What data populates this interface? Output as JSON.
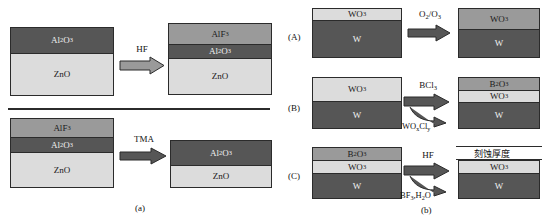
{
  "figure": {
    "panel_a_tag": "(a)",
    "panel_b_tag": "(b)"
  },
  "panel_a": {
    "rows": [
      {
        "reactant": "HF",
        "before": {
          "layers": [
            {
              "label": "Al2O3",
              "label_html": "Al₂O₃",
              "shade": "dark",
              "thickness": 26
            },
            {
              "label": "ZnO",
              "label_html": "ZnO",
              "shade": "light",
              "thickness": 41
            }
          ]
        },
        "after": {
          "layers": [
            {
              "label": "AlF3",
              "label_html": "AlF₃",
              "shade": "mid",
              "thickness": 20
            },
            {
              "label": "Al2O3",
              "label_html": "Al₂O₃",
              "shade": "dark",
              "thickness": 14
            },
            {
              "label": "ZnO",
              "label_html": "ZnO",
              "shade": "light",
              "thickness": 36
            }
          ]
        }
      },
      {
        "reactant": "TMA",
        "before": {
          "layers": [
            {
              "label": "AlF3",
              "label_html": "AlF₃",
              "shade": "mid",
              "thickness": 18
            },
            {
              "label": "Al2O3",
              "label_html": "Al₂O₃",
              "shade": "dark",
              "thickness": 15
            },
            {
              "label": "ZnO",
              "label_html": "ZnO",
              "shade": "light",
              "thickness": 35
            }
          ]
        },
        "after": {
          "layers": [
            {
              "label": "Al2O3",
              "label_html": "Al₂O₃",
              "shade": "dark",
              "thickness": 24
            },
            {
              "label": "ZnO",
              "label_html": "ZnO",
              "shade": "light",
              "thickness": 22
            }
          ]
        }
      }
    ]
  },
  "panel_b": {
    "rows": [
      {
        "row_label": "(A)",
        "reactant": "O2/O3",
        "reactant_html": "O₂/O₃",
        "byproduct": "",
        "byproduct_html": "",
        "before": {
          "layers": [
            {
              "label": "WO3",
              "label_html": "WO₃",
              "shade": "light",
              "thickness": 12
            },
            {
              "label": "W",
              "label_html": "W",
              "shade": "dark",
              "thickness": 35
            }
          ]
        },
        "after": {
          "layers": [
            {
              "label": "WO3",
              "label_html": "WO₃",
              "shade": "mid",
              "thickness": 20
            },
            {
              "label": "W",
              "label_html": "W",
              "shade": "dark",
              "thickness": 27
            }
          ]
        }
      },
      {
        "row_label": "(B)",
        "reactant": "BCl3",
        "reactant_html": "BCl₃",
        "byproduct": "WOxCly",
        "byproduct_html": "WO<sub>x</sub>Cl<sub>y</sub>",
        "before": {
          "layers": [
            {
              "label": "WO3",
              "label_html": "WO₃",
              "shade": "light",
              "thickness": 22
            },
            {
              "label": "W",
              "label_html": "W",
              "shade": "dark",
              "thickness": 28
            }
          ]
        },
        "after": {
          "layers": [
            {
              "label": "B2O3",
              "label_html": "B₂O₃",
              "shade": "mid",
              "thickness": 13
            },
            {
              "label": "WO3",
              "label_html": "WO₃",
              "shade": "light",
              "thickness": 12
            },
            {
              "label": "W",
              "label_html": "W",
              "shade": "dark",
              "thickness": 25
            }
          ]
        }
      },
      {
        "row_label": "(C)",
        "reactant": "HF",
        "reactant_html": "HF",
        "byproduct": "BF3,H2O",
        "byproduct_html": "BF<sub>3</sub>,H<sub>2</sub>O",
        "annotation": "刻蚀厚度",
        "before": {
          "layers": [
            {
              "label": "B2O3",
              "label_html": "B₂O₃",
              "shade": "mid",
              "thickness": 13
            },
            {
              "label": "WO3",
              "label_html": "WO₃",
              "shade": "light",
              "thickness": 12
            },
            {
              "label": "W",
              "label_html": "W",
              "shade": "dark",
              "thickness": 25
            }
          ]
        },
        "after": {
          "layers": [
            {
              "label": "WO3",
              "label_html": "WO₃",
              "shade": "light",
              "thickness": 12
            },
            {
              "label": "W",
              "label_html": "W",
              "shade": "dark",
              "thickness": 25
            }
          ]
        }
      }
    ]
  },
  "colors": {
    "dark": "#565656",
    "mid": "#9a9a9a",
    "light": "#dcdcdc",
    "outline": "#2b2b2b",
    "background": "#ffffff"
  }
}
